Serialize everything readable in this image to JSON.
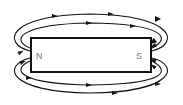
{
  "diagram": {
    "magnet": {
      "north_label": "N",
      "south_label": "S"
    },
    "colors": {
      "line": "#111111",
      "pole_text": "#777777",
      "background": "#ffffff"
    }
  }
}
